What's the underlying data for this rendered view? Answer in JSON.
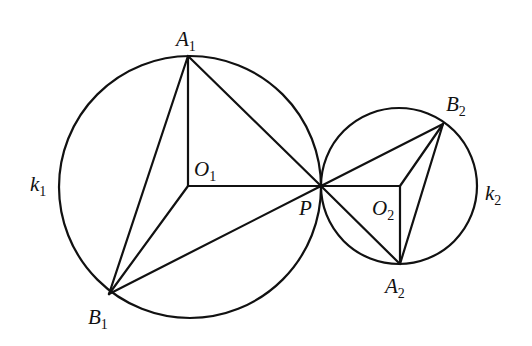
{
  "diagram": {
    "type": "geometry",
    "stroke_color": "#111111",
    "background": "#ffffff",
    "circles": [
      {
        "name": "k1",
        "center": "O1",
        "cx": 190,
        "cy": 187,
        "r": 131
      },
      {
        "name": "k2",
        "center": "O2",
        "cx": 399,
        "cy": 186,
        "r": 78
      }
    ],
    "points": {
      "A1": {
        "x": 188,
        "y": 56
      },
      "B1": {
        "x": 109,
        "y": 294
      },
      "O1": {
        "x": 188,
        "y": 186
      },
      "P": {
        "x": 321,
        "y": 186
      },
      "O2": {
        "x": 400,
        "y": 186
      },
      "A2": {
        "x": 400,
        "y": 264
      },
      "B2": {
        "x": 443,
        "y": 124
      }
    },
    "segments": [
      [
        "A1",
        "B1"
      ],
      [
        "A1",
        "O1"
      ],
      [
        "A1",
        "P"
      ],
      [
        "O1",
        "B1"
      ],
      [
        "O1",
        "P"
      ],
      [
        "B1",
        "P"
      ],
      [
        "P",
        "B2"
      ],
      [
        "P",
        "O2"
      ],
      [
        "P",
        "A2"
      ],
      [
        "O2",
        "B2"
      ],
      [
        "O2",
        "A2"
      ],
      [
        "A2",
        "B2"
      ]
    ],
    "labels": {
      "A1": {
        "main": "A",
        "sub": "1"
      },
      "B1": {
        "main": "B",
        "sub": "1"
      },
      "O1": {
        "main": "O",
        "sub": "1"
      },
      "k1": {
        "main": "k",
        "sub": "1"
      },
      "P": {
        "main": "P",
        "sub": ""
      },
      "O2": {
        "main": "O",
        "sub": "2"
      },
      "A2": {
        "main": "A",
        "sub": "2"
      },
      "B2": {
        "main": "B",
        "sub": "2"
      },
      "k2": {
        "main": "k",
        "sub": "2"
      }
    }
  }
}
